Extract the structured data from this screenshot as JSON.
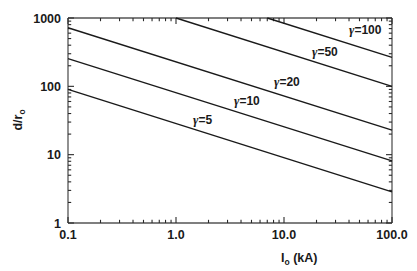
{
  "chart_data": {
    "type": "line",
    "title": "",
    "xlabel": "I_o (kA)",
    "ylabel": "d/r_o",
    "xscale": "log",
    "yscale": "log",
    "xlim": [
      0.1,
      100.0
    ],
    "ylim": [
      1,
      1000
    ],
    "grid": false,
    "legend_position": "inline-annotations",
    "xticks": [
      0.1,
      1.0,
      10.0,
      100.0
    ],
    "xticklabels": [
      "0.1",
      "1.0",
      "10.0",
      "100.0"
    ],
    "yticks": [
      1,
      10,
      100,
      1000
    ],
    "yticklabels": [
      "1",
      "10",
      "100",
      "1000"
    ],
    "minor_ticks": true,
    "series": [
      {
        "name": "gamma=5",
        "label": "γ=5",
        "points": [
          [
            0.1,
            90
          ],
          [
            100.0,
            2.85
          ]
        ],
        "slope_loglog": -0.5
      },
      {
        "name": "gamma=10",
        "label": "γ=10",
        "points": [
          [
            0.1,
            255
          ],
          [
            100.0,
            8.1
          ]
        ],
        "slope_loglog": -0.5
      },
      {
        "name": "gamma=20",
        "label": "γ=20",
        "points": [
          [
            0.1,
            720
          ],
          [
            100.0,
            22.8
          ]
        ],
        "slope_loglog": -0.5
      },
      {
        "name": "gamma=50",
        "label": "γ=50",
        "points": [
          [
            1.0,
            1000
          ],
          [
            100.0,
            100
          ]
        ],
        "slope_loglog": -0.5
      },
      {
        "name": "gamma=100",
        "label": "γ=100",
        "points": [
          [
            7.0,
            1000
          ],
          [
            100.0,
            265
          ]
        ],
        "slope_loglog": -0.5
      }
    ],
    "annotations": [
      {
        "text": "γ=100",
        "gamma_char": "γ",
        "rest": "=100",
        "x_px": 349,
        "y_px": 34
      },
      {
        "text": "γ=50",
        "gamma_char": "γ",
        "rest": "=50",
        "x_px": 312,
        "y_px": 56
      },
      {
        "text": "γ=20",
        "gamma_char": "γ",
        "rest": "=20",
        "x_px": 274,
        "y_px": 86
      },
      {
        "text": "γ=10",
        "gamma_char": "γ",
        "rest": "=10",
        "x_px": 234,
        "y_px": 105
      },
      {
        "text": "γ=5",
        "gamma_char": "γ",
        "rest": "=5",
        "x_px": 193,
        "y_px": 124
      }
    ]
  },
  "axes": {
    "x_label_main": "I",
    "x_label_sub": "o",
    "x_label_unit": " (kA)",
    "y_label_main": "d/r",
    "y_label_sub": "o"
  },
  "colors": {
    "line": "#1a1a1a",
    "axis": "#4a4a4a",
    "text": "#1a1a1a",
    "background": "#ffffff"
  }
}
